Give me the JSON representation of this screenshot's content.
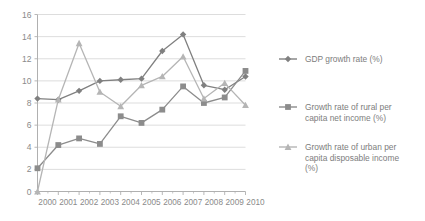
{
  "chart_data": {
    "type": "line",
    "title": "",
    "subtitle": "",
    "xlabel": "",
    "ylabel": "",
    "x": [
      "2000",
      "2001",
      "2002",
      "2003",
      "2004",
      "2005",
      "2006",
      "2007",
      "2008",
      "2009",
      "2010"
    ],
    "categories": [
      "2000",
      "2001",
      "2002",
      "2003",
      "2004",
      "2005",
      "2006",
      "2007",
      "2008",
      "2009",
      "2010"
    ],
    "xlim": [
      2000,
      2010
    ],
    "ylim": [
      0,
      16
    ],
    "ytick_labels": [
      "0",
      "2",
      "4",
      "6",
      "8",
      "10",
      "12",
      "14",
      "16"
    ],
    "yticks": [
      0,
      2,
      4,
      6,
      8,
      10,
      12,
      14,
      16
    ],
    "grid": "horizontal",
    "legend_position": "right",
    "series": [
      {
        "name": "GDP growth rate (%)",
        "color": "#808080",
        "marker": "diamond",
        "values": [
          8.4,
          8.3,
          9.1,
          10.0,
          10.1,
          10.2,
          12.7,
          14.2,
          9.6,
          9.2,
          10.4
        ]
      },
      {
        "name": "Growth rate of rural per capita net income (%)",
        "color": "#8c8c8c",
        "marker": "square",
        "values": [
          2.1,
          4.2,
          4.8,
          4.3,
          6.8,
          6.2,
          7.4,
          9.5,
          8.0,
          8.5,
          10.9
        ]
      },
      {
        "name": "Growth rate of urban per capita disposable income (%)",
        "color": "#b5b5b5",
        "marker": "triangle",
        "values": [
          0.0,
          8.3,
          13.4,
          9.0,
          7.7,
          9.6,
          10.4,
          12.2,
          8.4,
          9.8,
          7.8
        ]
      }
    ]
  },
  "legend": {
    "items": [
      {
        "label": "GDP growth rate (%)"
      },
      {
        "label": "Growth rate of rural per capita net income (%)"
      },
      {
        "label": "Growth rate of urban per capita disposable income (%)"
      }
    ]
  },
  "colors": {
    "axis": "#b0b0b0",
    "grid": "#d9d9d9",
    "text": "#8a8a8a",
    "series1": "#808080",
    "series2": "#8c8c8c",
    "series3": "#b5b5b5",
    "background": "#ffffff"
  }
}
